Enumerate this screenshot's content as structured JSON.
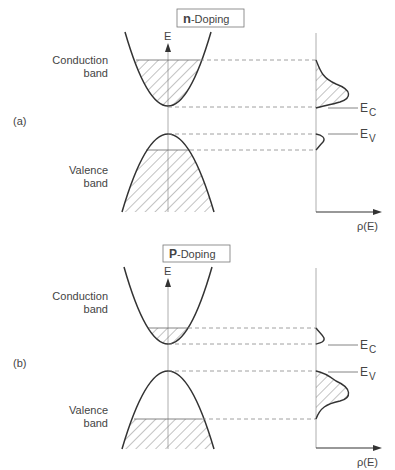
{
  "panels": [
    {
      "id": "a",
      "tag": "(a)",
      "title_bold": "n",
      "title_rest": "-Doping",
      "axis_label": "E",
      "conduction_label_1": "Conduction",
      "conduction_label_2": "band",
      "valence_label_1": "Valence",
      "valence_label_2": "band",
      "ec_label": "E",
      "ec_sub": "C",
      "ev_label": "E",
      "ev_sub": "V",
      "dos_label": "ρ(E)"
    },
    {
      "id": "b",
      "tag": "(b)",
      "title_bold": "P",
      "title_rest": "-Doping",
      "axis_label": "E",
      "conduction_label_1": "Conduction",
      "conduction_label_2": "band",
      "valence_label_1": "Valence",
      "valence_label_2": "band",
      "ec_label": "E",
      "ec_sub": "C",
      "ev_label": "E",
      "ev_sub": "V",
      "dos_label": "ρ(E)"
    }
  ],
  "colors": {
    "line": "#333333",
    "hatch": "#777777",
    "dash": "#888888"
  }
}
